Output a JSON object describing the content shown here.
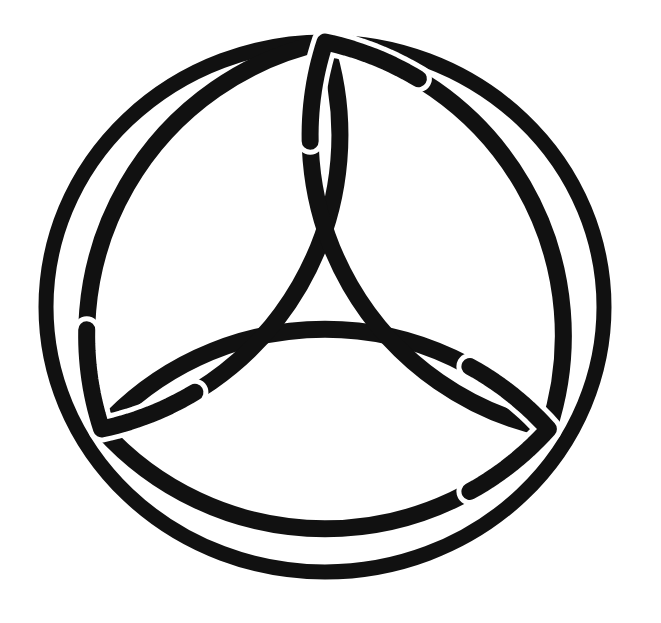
{
  "image": {
    "title": "Triquetra in Circle",
    "description": "Celtic trinity knot (triquetra) enclosed by a circle, drawn as thick black line art on a plain white background",
    "width": 661,
    "height": 623,
    "background_color": "#ffffff",
    "ink_color": "#111111",
    "style": "scanned black-and-white line drawing"
  },
  "symbol": {
    "name": "triquetra-in-circle",
    "alt_names": [
      "Trinity Knot",
      "Celtic Triquetra",
      "Trefoil Knot Symbol"
    ],
    "element_count": 4,
    "elements": [
      {
        "name": "outer-circle",
        "shape": "ellipse",
        "center_x": 325,
        "center_y": 307,
        "radius_x": 279,
        "radius_y": 265,
        "stroke_width": 15,
        "color": "#111111"
      },
      {
        "name": "petal-top",
        "shape": "vesica-petal",
        "rotation_deg": 0,
        "apex_x": 330,
        "apex_y": 55,
        "stroke_width": 17,
        "color": "#111111"
      },
      {
        "name": "petal-lower-left",
        "shape": "vesica-petal",
        "rotation_deg": 120,
        "apex_x": 107,
        "apex_y": 437,
        "stroke_width": 17,
        "color": "#111111"
      },
      {
        "name": "petal-lower-right",
        "shape": "vesica-petal",
        "rotation_deg": 240,
        "apex_x": 560,
        "apex_y": 440,
        "stroke_width": 17,
        "color": "#111111"
      }
    ],
    "knot": {
      "center_x": 325,
      "center_y": 300,
      "petal_apex_radius": 258,
      "arc_radius": 300,
      "interlaced": true,
      "crossing_count": 6
    }
  },
  "geometry_notes": {
    "petal_arc_sweep": "each petal is bounded by two circular arcs meeting at two cusps",
    "symmetry": "3-fold rotational symmetry about the center, with a vertical mirror axis",
    "circle_tangency": "the three petal cusps lie on or just inside the enclosing circle"
  }
}
